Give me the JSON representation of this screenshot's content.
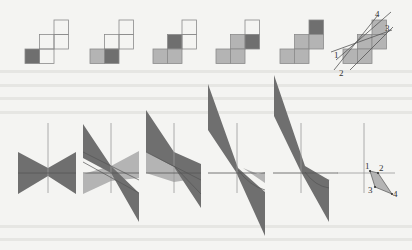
{
  "figure": {
    "background": "#f4f4f2",
    "colors": {
      "dark": "#6f6f6f",
      "light": "#b4b4b4",
      "outline": "#8a8a8a",
      "axis": "#9a9a9a"
    },
    "grid_panels": [
      {
        "id": 1,
        "x": 25,
        "cells": [
          {
            "c": 2,
            "r": 0,
            "fill": "none"
          },
          {
            "c": 1,
            "r": 1,
            "fill": "none"
          },
          {
            "c": 2,
            "r": 1,
            "fill": "none"
          },
          {
            "c": 0,
            "r": 2,
            "fill": "dark"
          },
          {
            "c": 1,
            "r": 2,
            "fill": "none"
          }
        ]
      },
      {
        "id": 2,
        "x": 90,
        "cells": [
          {
            "c": 2,
            "r": 0,
            "fill": "none"
          },
          {
            "c": 1,
            "r": 1,
            "fill": "none"
          },
          {
            "c": 2,
            "r": 1,
            "fill": "none"
          },
          {
            "c": 0,
            "r": 2,
            "fill": "light"
          },
          {
            "c": 1,
            "r": 2,
            "fill": "dark"
          }
        ]
      },
      {
        "id": 3,
        "x": 153,
        "cells": [
          {
            "c": 2,
            "r": 0,
            "fill": "none"
          },
          {
            "c": 1,
            "r": 1,
            "fill": "dark"
          },
          {
            "c": 2,
            "r": 1,
            "fill": "none"
          },
          {
            "c": 0,
            "r": 2,
            "fill": "light"
          },
          {
            "c": 1,
            "r": 2,
            "fill": "light"
          }
        ]
      },
      {
        "id": 4,
        "x": 216,
        "cells": [
          {
            "c": 2,
            "r": 0,
            "fill": "none"
          },
          {
            "c": 1,
            "r": 1,
            "fill": "light"
          },
          {
            "c": 2,
            "r": 1,
            "fill": "dark"
          },
          {
            "c": 0,
            "r": 2,
            "fill": "light"
          },
          {
            "c": 1,
            "r": 2,
            "fill": "light"
          }
        ]
      },
      {
        "id": 5,
        "x": 280,
        "cells": [
          {
            "c": 2,
            "r": 0,
            "fill": "dark"
          },
          {
            "c": 1,
            "r": 1,
            "fill": "light"
          },
          {
            "c": 2,
            "r": 1,
            "fill": "light"
          },
          {
            "c": 0,
            "r": 2,
            "fill": "light"
          },
          {
            "c": 1,
            "r": 2,
            "fill": "light"
          }
        ]
      },
      {
        "id": 6,
        "x": 343,
        "cells": [
          {
            "c": 2,
            "r": 0,
            "fill": "light"
          },
          {
            "c": 1,
            "r": 1,
            "fill": "light"
          },
          {
            "c": 2,
            "r": 1,
            "fill": "light"
          },
          {
            "c": 0,
            "r": 2,
            "fill": "light"
          },
          {
            "c": 1,
            "r": 2,
            "fill": "light"
          }
        ]
      }
    ],
    "line_labels": [
      "1",
      "2",
      "3",
      "4"
    ],
    "vertex_labels": [
      "1",
      "2",
      "3",
      "4"
    ]
  }
}
